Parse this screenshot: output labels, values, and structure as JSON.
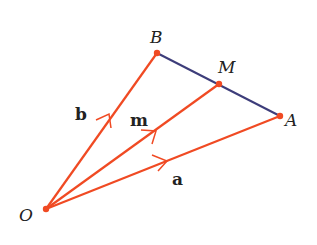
{
  "diagram": {
    "title": "",
    "colors": {
      "vector": "#f04a23",
      "segment": "#3d3d7a",
      "point": "#f04a23",
      "label": "#222222"
    },
    "points": {
      "O": {
        "label": "O",
        "x": 46,
        "y": 209
      },
      "A": {
        "label": "A",
        "x": 280,
        "y": 116
      },
      "B": {
        "label": "B",
        "x": 157,
        "y": 53
      },
      "M": {
        "label": "M",
        "x": 219,
        "y": 84
      }
    },
    "vectors": [
      {
        "name": "a",
        "label": "a",
        "from": "O",
        "to": "A"
      },
      {
        "name": "b",
        "label": "b",
        "from": "O",
        "to": "B"
      },
      {
        "name": "m",
        "label": "m",
        "from": "O",
        "to": "M"
      }
    ],
    "segments": [
      {
        "from": "B",
        "to": "A"
      }
    ]
  }
}
